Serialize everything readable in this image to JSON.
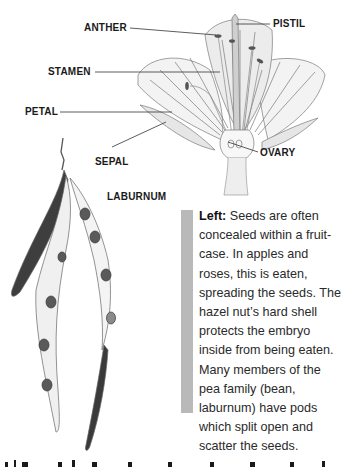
{
  "diagram": {
    "labels": {
      "anther": "ANTHER",
      "pistil": "PISTIL",
      "stamen": "STAMEN",
      "petal": "PETAL",
      "sepal": "SEPAL",
      "ovary": "OVARY"
    },
    "plant_label": "LABURNUM"
  },
  "caption": {
    "lead": "Left:",
    "text": " Seeds are often concealed within a fruit-case. In apples and roses, this is eaten, spreading the seeds. The hazel nut’s hard shell protects the embryo inside from being eaten. Many members of the pea family (bean, laburnum) have pods which split open and scatter the seeds."
  },
  "colors": {
    "caption_bar": "#b9b9b9",
    "text": "#2a2a2a",
    "background": "#ffffff"
  }
}
